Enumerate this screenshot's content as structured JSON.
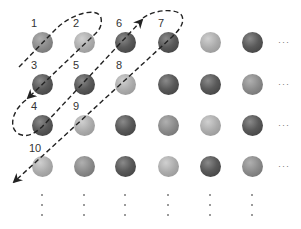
{
  "diagram": {
    "type": "grid enumeration with diagonal zig-zag path",
    "labels": [
      "1",
      "2",
      "3",
      "4",
      "5",
      "6",
      "7",
      "8",
      "9",
      "10"
    ],
    "label_positions": [
      {
        "text": "1",
        "col": 0,
        "row": 0
      },
      {
        "text": "2",
        "col": 1,
        "row": 0
      },
      {
        "text": "3",
        "col": 0,
        "row": 1
      },
      {
        "text": "4",
        "col": 0,
        "row": 2
      },
      {
        "text": "5",
        "col": 1,
        "row": 1
      },
      {
        "text": "6",
        "col": 2,
        "row": 0
      },
      {
        "text": "7",
        "col": 3,
        "row": 0
      },
      {
        "text": "8",
        "col": 2,
        "row": 1
      },
      {
        "text": "9",
        "col": 1,
        "row": 2
      },
      {
        "text": "10",
        "col": 0,
        "row": 3
      }
    ],
    "grid": {
      "columns": 6,
      "rows": 4,
      "shades": [
        [
          "medium",
          "light",
          "dark",
          "dark",
          "light",
          "dark"
        ],
        [
          "dark",
          "dark",
          "light",
          "dark",
          "dark",
          "medium"
        ],
        [
          "dark",
          "light",
          "dark",
          "medium",
          "light",
          "dark"
        ],
        [
          "light",
          "medium",
          "dark",
          "light",
          "dark",
          "medium"
        ]
      ]
    },
    "row_continuation": "···",
    "column_continuation": "⋮",
    "colors": {
      "dark": "#4a4a4a",
      "medium": "#8a8a8a",
      "light": "#ababab",
      "path": "#222222",
      "label": "#333333"
    }
  }
}
